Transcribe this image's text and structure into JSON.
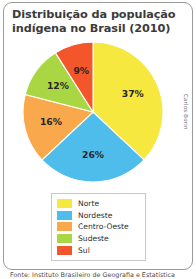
{
  "card": {
    "title": "Distribuição da população indígena no Brasil (2010)",
    "credit": "Carlos Borin",
    "caption": "Fonte: Instituto Brasileiro de Geografia e Estatística"
  },
  "legend": {
    "items": [
      {
        "label": "Norte",
        "color": "#F7E83F"
      },
      {
        "label": "Nordeste",
        "color": "#4FBDEC"
      },
      {
        "label": "Centro-Oeste",
        "color": "#F9A94C"
      },
      {
        "label": "Sudeste",
        "color": "#A9D744"
      },
      {
        "label": "Sul",
        "color": "#F4562C"
      }
    ]
  },
  "chart_data": {
    "type": "pie",
    "title": "Distribuição da população indígena no Brasil (2010)",
    "xlabel": "",
    "ylabel": "",
    "legend_position": "bottom",
    "start_angle_deg": 0,
    "direction": "clockwise",
    "categories": [
      "Norte",
      "Nordeste",
      "Centro-Oeste",
      "Sudeste",
      "Sul"
    ],
    "values": [
      37,
      26,
      16,
      12,
      9
    ],
    "value_labels": [
      "37%",
      "26%",
      "16%",
      "12%",
      "9%"
    ],
    "colors": [
      "#F7E83F",
      "#4FBDEC",
      "#F9A94C",
      "#A9D744",
      "#F4562C"
    ],
    "units": "percent"
  }
}
